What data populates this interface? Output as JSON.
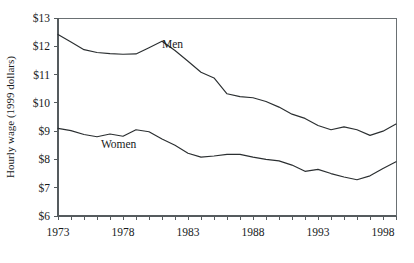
{
  "chart_data": {
    "type": "line",
    "title": "",
    "xlabel": "",
    "ylabel": "Hourly wage (1999 dollars)",
    "xlim": [
      1973,
      1999
    ],
    "ylim": [
      6,
      13
    ],
    "grid": false,
    "legend": "inline-labels",
    "y_tick_labels": [
      "$13",
      "$12",
      "$11",
      "$10",
      "$9",
      "$8",
      "$7",
      "$6"
    ],
    "y_tick_values": [
      13,
      12,
      11,
      10,
      9,
      8,
      7,
      6
    ],
    "x_tick_labels": [
      "1973",
      "1978",
      "1983",
      "1988",
      "1993",
      "1998"
    ],
    "x_tick_values": [
      1973,
      1978,
      1983,
      1988,
      1993,
      1998
    ],
    "x_minor_ticks": [
      1973,
      1974,
      1975,
      1976,
      1977,
      1978,
      1979,
      1980,
      1981,
      1982,
      1983,
      1984,
      1985,
      1986,
      1987,
      1988,
      1989,
      1990,
      1991,
      1992,
      1993,
      1994,
      1995,
      1996,
      1997,
      1998,
      1999
    ],
    "x": [
      1973,
      1974,
      1975,
      1976,
      1977,
      1978,
      1979,
      1980,
      1981,
      1982,
      1983,
      1984,
      1985,
      1986,
      1987,
      1988,
      1989,
      1990,
      1991,
      1992,
      1993,
      1994,
      1995,
      1996,
      1997,
      1998,
      1999
    ],
    "series": [
      {
        "name": "Men",
        "label": "Men",
        "label_x": 1981.0,
        "label_y": 11.95,
        "color": "#2b2f31",
        "values": [
          12.42,
          12.15,
          11.88,
          11.78,
          11.74,
          11.72,
          11.73,
          11.95,
          12.18,
          11.85,
          11.47,
          11.08,
          10.88,
          10.32,
          10.22,
          10.18,
          10.05,
          9.85,
          9.6,
          9.45,
          9.2,
          9.05,
          9.15,
          9.05,
          8.85,
          9.0,
          9.25
        ]
      },
      {
        "name": "Women",
        "label": "Women",
        "label_x": 1976.3,
        "label_y": 8.42,
        "color": "#2b2f31",
        "values": [
          9.1,
          9.02,
          8.88,
          8.8,
          8.9,
          8.82,
          9.05,
          8.98,
          8.72,
          8.5,
          8.22,
          8.08,
          8.12,
          8.18,
          8.18,
          8.08,
          8.0,
          7.95,
          7.8,
          7.58,
          7.65,
          7.5,
          7.38,
          7.28,
          7.42,
          7.68,
          7.92
        ]
      }
    ]
  },
  "layout": {
    "plot_left": 58,
    "plot_right": 396,
    "plot_top": 18,
    "plot_bottom": 216
  }
}
